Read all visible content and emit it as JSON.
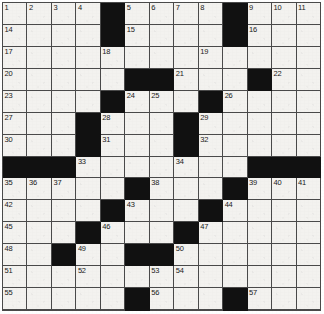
{
  "puzzle": {
    "type": "crossword-grid",
    "title": "Crossword puzzle grid",
    "columns": 13,
    "rows": 14,
    "colors": {
      "block": "#111111",
      "cell": "#f3f2ef",
      "grid_line": "#4a4a4a",
      "number": "#1a1a1a"
    },
    "legend": {
      "block_label": "blocked-square",
      "open_label": "open-square"
    },
    "cells": [
      [
        {
          "b": 0,
          "n": "1"
        },
        {
          "b": 0,
          "n": "2"
        },
        {
          "b": 0,
          "n": "3"
        },
        {
          "b": 0,
          "n": "4"
        },
        {
          "b": 1,
          "n": ""
        },
        {
          "b": 0,
          "n": "5"
        },
        {
          "b": 0,
          "n": "6"
        },
        {
          "b": 0,
          "n": "7"
        },
        {
          "b": 0,
          "n": "8"
        },
        {
          "b": 1,
          "n": ""
        },
        {
          "b": 0,
          "n": "9"
        },
        {
          "b": 0,
          "n": "10"
        },
        {
          "b": 0,
          "n": "11"
        }
      ],
      [
        {
          "b": 0,
          "n": "14"
        },
        {
          "b": 0,
          "n": ""
        },
        {
          "b": 0,
          "n": ""
        },
        {
          "b": 0,
          "n": ""
        },
        {
          "b": 1,
          "n": ""
        },
        {
          "b": 0,
          "n": "15"
        },
        {
          "b": 0,
          "n": ""
        },
        {
          "b": 0,
          "n": ""
        },
        {
          "b": 0,
          "n": ""
        },
        {
          "b": 1,
          "n": ""
        },
        {
          "b": 0,
          "n": "16"
        },
        {
          "b": 0,
          "n": ""
        },
        {
          "b": 0,
          "n": ""
        }
      ],
      [
        {
          "b": 0,
          "n": "17"
        },
        {
          "b": 0,
          "n": ""
        },
        {
          "b": 0,
          "n": ""
        },
        {
          "b": 0,
          "n": ""
        },
        {
          "b": 0,
          "n": "18"
        },
        {
          "b": 0,
          "n": ""
        },
        {
          "b": 0,
          "n": ""
        },
        {
          "b": 0,
          "n": ""
        },
        {
          "b": 0,
          "n": "19"
        },
        {
          "b": 0,
          "n": ""
        },
        {
          "b": 0,
          "n": ""
        },
        {
          "b": 0,
          "n": ""
        },
        {
          "b": 0,
          "n": ""
        }
      ],
      [
        {
          "b": 0,
          "n": "20"
        },
        {
          "b": 0,
          "n": ""
        },
        {
          "b": 0,
          "n": ""
        },
        {
          "b": 0,
          "n": ""
        },
        {
          "b": 0,
          "n": ""
        },
        {
          "b": 1,
          "n": ""
        },
        {
          "b": 1,
          "n": ""
        },
        {
          "b": 0,
          "n": "21"
        },
        {
          "b": 0,
          "n": ""
        },
        {
          "b": 0,
          "n": ""
        },
        {
          "b": 1,
          "n": ""
        },
        {
          "b": 0,
          "n": "22"
        },
        {
          "b": 0,
          "n": ""
        }
      ],
      [
        {
          "b": 0,
          "n": "23"
        },
        {
          "b": 0,
          "n": ""
        },
        {
          "b": 0,
          "n": ""
        },
        {
          "b": 0,
          "n": ""
        },
        {
          "b": 1,
          "n": ""
        },
        {
          "b": 0,
          "n": "24"
        },
        {
          "b": 0,
          "n": "25"
        },
        {
          "b": 0,
          "n": ""
        },
        {
          "b": 1,
          "n": ""
        },
        {
          "b": 0,
          "n": "26"
        },
        {
          "b": 0,
          "n": ""
        },
        {
          "b": 0,
          "n": ""
        },
        {
          "b": 0,
          "n": ""
        }
      ],
      [
        {
          "b": 0,
          "n": "27"
        },
        {
          "b": 0,
          "n": ""
        },
        {
          "b": 0,
          "n": ""
        },
        {
          "b": 1,
          "n": ""
        },
        {
          "b": 0,
          "n": "28"
        },
        {
          "b": 0,
          "n": ""
        },
        {
          "b": 0,
          "n": ""
        },
        {
          "b": 1,
          "n": ""
        },
        {
          "b": 0,
          "n": "29"
        },
        {
          "b": 0,
          "n": ""
        },
        {
          "b": 0,
          "n": ""
        },
        {
          "b": 0,
          "n": ""
        },
        {
          "b": 0,
          "n": ""
        }
      ],
      [
        {
          "b": 0,
          "n": "30"
        },
        {
          "b": 0,
          "n": ""
        },
        {
          "b": 0,
          "n": ""
        },
        {
          "b": 1,
          "n": ""
        },
        {
          "b": 0,
          "n": "31"
        },
        {
          "b": 0,
          "n": ""
        },
        {
          "b": 0,
          "n": ""
        },
        {
          "b": 1,
          "n": ""
        },
        {
          "b": 0,
          "n": "32"
        },
        {
          "b": 0,
          "n": ""
        },
        {
          "b": 0,
          "n": ""
        },
        {
          "b": 0,
          "n": ""
        },
        {
          "b": 0,
          "n": ""
        }
      ],
      [
        {
          "b": 1,
          "n": ""
        },
        {
          "b": 1,
          "n": ""
        },
        {
          "b": 1,
          "n": ""
        },
        {
          "b": 0,
          "n": "33"
        },
        {
          "b": 0,
          "n": ""
        },
        {
          "b": 0,
          "n": ""
        },
        {
          "b": 0,
          "n": ""
        },
        {
          "b": 0,
          "n": "34"
        },
        {
          "b": 0,
          "n": ""
        },
        {
          "b": 0,
          "n": ""
        },
        {
          "b": 1,
          "n": ""
        },
        {
          "b": 1,
          "n": ""
        },
        {
          "b": 1,
          "n": ""
        }
      ],
      [
        {
          "b": 0,
          "n": "35"
        },
        {
          "b": 0,
          "n": "36"
        },
        {
          "b": 0,
          "n": "37"
        },
        {
          "b": 0,
          "n": ""
        },
        {
          "b": 0,
          "n": ""
        },
        {
          "b": 1,
          "n": ""
        },
        {
          "b": 0,
          "n": "38"
        },
        {
          "b": 0,
          "n": ""
        },
        {
          "b": 0,
          "n": ""
        },
        {
          "b": 1,
          "n": ""
        },
        {
          "b": 0,
          "n": "39"
        },
        {
          "b": 0,
          "n": "40"
        },
        {
          "b": 0,
          "n": "41"
        }
      ],
      [
        {
          "b": 0,
          "n": "42"
        },
        {
          "b": 0,
          "n": ""
        },
        {
          "b": 0,
          "n": ""
        },
        {
          "b": 0,
          "n": ""
        },
        {
          "b": 1,
          "n": ""
        },
        {
          "b": 0,
          "n": "43"
        },
        {
          "b": 0,
          "n": ""
        },
        {
          "b": 0,
          "n": ""
        },
        {
          "b": 1,
          "n": ""
        },
        {
          "b": 0,
          "n": "44"
        },
        {
          "b": 0,
          "n": ""
        },
        {
          "b": 0,
          "n": ""
        },
        {
          "b": 0,
          "n": ""
        }
      ],
      [
        {
          "b": 0,
          "n": "45"
        },
        {
          "b": 0,
          "n": ""
        },
        {
          "b": 0,
          "n": ""
        },
        {
          "b": 1,
          "n": ""
        },
        {
          "b": 0,
          "n": "46"
        },
        {
          "b": 0,
          "n": ""
        },
        {
          "b": 0,
          "n": ""
        },
        {
          "b": 1,
          "n": ""
        },
        {
          "b": 0,
          "n": "47"
        },
        {
          "b": 0,
          "n": ""
        },
        {
          "b": 0,
          "n": ""
        },
        {
          "b": 0,
          "n": ""
        },
        {
          "b": 0,
          "n": ""
        }
      ],
      [
        {
          "b": 0,
          "n": "48"
        },
        {
          "b": 0,
          "n": ""
        },
        {
          "b": 1,
          "n": ""
        },
        {
          "b": 0,
          "n": "49"
        },
        {
          "b": 0,
          "n": ""
        },
        {
          "b": 1,
          "n": ""
        },
        {
          "b": 1,
          "n": ""
        },
        {
          "b": 0,
          "n": "50"
        },
        {
          "b": 0,
          "n": ""
        },
        {
          "b": 0,
          "n": ""
        },
        {
          "b": 0,
          "n": ""
        },
        {
          "b": 0,
          "n": ""
        },
        {
          "b": 0,
          "n": ""
        }
      ],
      [
        {
          "b": 0,
          "n": "51"
        },
        {
          "b": 0,
          "n": ""
        },
        {
          "b": 0,
          "n": ""
        },
        {
          "b": 0,
          "n": "52"
        },
        {
          "b": 0,
          "n": ""
        },
        {
          "b": 0,
          "n": ""
        },
        {
          "b": 0,
          "n": "53"
        },
        {
          "b": 0,
          "n": "54"
        },
        {
          "b": 0,
          "n": ""
        },
        {
          "b": 0,
          "n": ""
        },
        {
          "b": 0,
          "n": ""
        },
        {
          "b": 0,
          "n": ""
        },
        {
          "b": 0,
          "n": ""
        }
      ],
      [
        {
          "b": 0,
          "n": "55"
        },
        {
          "b": 0,
          "n": ""
        },
        {
          "b": 0,
          "n": ""
        },
        {
          "b": 0,
          "n": ""
        },
        {
          "b": 0,
          "n": ""
        },
        {
          "b": 1,
          "n": ""
        },
        {
          "b": 0,
          "n": "56"
        },
        {
          "b": 0,
          "n": ""
        },
        {
          "b": 0,
          "n": ""
        },
        {
          "b": 1,
          "n": ""
        },
        {
          "b": 0,
          "n": "57"
        },
        {
          "b": 0,
          "n": ""
        },
        {
          "b": 0,
          "n": ""
        }
      ],
      [
        {
          "b": 0,
          "n": "58"
        },
        {
          "b": 0,
          "n": ""
        },
        {
          "b": 0,
          "n": ""
        },
        {
          "b": 0,
          "n": ""
        },
        {
          "b": 0,
          "n": ""
        },
        {
          "b": 1,
          "n": ""
        },
        {
          "b": 0,
          "n": "59"
        },
        {
          "b": 0,
          "n": ""
        },
        {
          "b": 0,
          "n": ""
        },
        {
          "b": 1,
          "n": ""
        },
        {
          "b": 0,
          "n": "60"
        },
        {
          "b": 0,
          "n": ""
        },
        {
          "b": 0,
          "n": ""
        }
      ]
    ]
  }
}
